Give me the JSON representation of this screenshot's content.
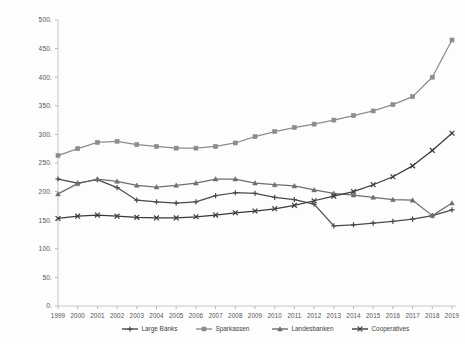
{
  "chart_data": {
    "type": "line",
    "title": "",
    "xlabel": "",
    "ylabel": "",
    "x": [
      1999,
      2000,
      2001,
      2002,
      2003,
      2004,
      2005,
      2006,
      2007,
      2008,
      2009,
      2010,
      2011,
      2012,
      2013,
      2014,
      2015,
      2016,
      2017,
      2018,
      2019
    ],
    "categories": [
      "1999",
      "2000",
      "2001",
      "2002",
      "2003",
      "2004",
      "2005",
      "2006",
      "2007",
      "2008",
      "2009",
      "2010",
      "2011",
      "2012",
      "2013",
      "2014",
      "2015",
      "2016",
      "2017",
      "2018",
      "2019"
    ],
    "ylim": [
      0,
      500
    ],
    "yticks": [
      0,
      50,
      100,
      150,
      200,
      250,
      300,
      350,
      400,
      450,
      500
    ],
    "ytick_labels": [
      "0.",
      "50.",
      "100.",
      "150.",
      "200.",
      "250.",
      "300.",
      "350.",
      "400.",
      "450.",
      "500."
    ],
    "grid": false,
    "legend_position": "bottom",
    "series": [
      {
        "name": "Large Banks",
        "marker": "plus",
        "color": "#4a4a4a",
        "values": [
          222,
          215,
          221,
          207,
          185,
          182,
          180,
          182,
          193,
          198,
          197,
          190,
          186,
          178,
          140,
          142,
          145,
          148,
          152,
          158,
          168
        ]
      },
      {
        "name": "Sparkassen",
        "marker": "square",
        "color": "#8c8c8c",
        "values": [
          263,
          275,
          286,
          288,
          282,
          279,
          276,
          276,
          279,
          285,
          296,
          305,
          312,
          318,
          325,
          333,
          341,
          352,
          366,
          400,
          465
        ]
      },
      {
        "name": "Landesbanken",
        "marker": "triangle",
        "color": "#6e6e6e",
        "values": [
          196,
          214,
          222,
          218,
          211,
          208,
          211,
          215,
          222,
          222,
          215,
          212,
          210,
          203,
          197,
          194,
          190,
          186,
          185,
          158,
          180
        ]
      },
      {
        "name": "Cooperatives",
        "marker": "cross",
        "color": "#3a3a3a",
        "values": [
          153,
          157,
          159,
          157,
          155,
          154,
          154,
          156,
          159,
          163,
          166,
          170,
          176,
          184,
          192,
          200,
          212,
          226,
          245,
          272,
          302
        ]
      }
    ]
  },
  "legend": {
    "items": [
      {
        "label": "Large Banks"
      },
      {
        "label": "Sparkassen"
      },
      {
        "label": "Landesbanken"
      },
      {
        "label": "Cooperatives"
      }
    ]
  },
  "colors": {
    "axis": "#c8c8c8",
    "text": "#555555",
    "background": "#fdfdfd"
  }
}
